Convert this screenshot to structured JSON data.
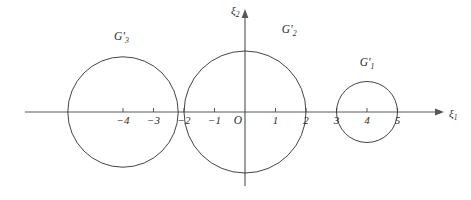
{
  "figure": {
    "background_color": "#ffffff",
    "axis_color": "#55585a",
    "curve_color": "#3a3a3a",
    "origin_label": "O"
  },
  "axes": {
    "x_axis": {
      "name": "xi-1",
      "label_base": "ξ",
      "label_sub": "1",
      "pixel_y": 112,
      "pixel_x_start": 25,
      "pixel_x_end": 437,
      "unit_px": 30.5,
      "origin_px": 245,
      "ticks": [
        {
          "value": -4,
          "label": "−4"
        },
        {
          "value": -3,
          "label": "−3"
        },
        {
          "value": -2,
          "label": "−2"
        },
        {
          "value": -1,
          "label": "−1"
        },
        {
          "value": 1,
          "label": "1"
        },
        {
          "value": 2,
          "label": "2"
        },
        {
          "value": 3,
          "label": "3"
        },
        {
          "value": 4,
          "label": "4"
        },
        {
          "value": 5,
          "label": "5"
        }
      ]
    },
    "y_axis": {
      "name": "xi-2",
      "label_base": "ξ",
      "label_sub": "2",
      "pixel_x": 245,
      "pixel_y_top": 16,
      "pixel_y_bottom": 186,
      "ticks": []
    }
  },
  "chart_data": {
    "type": "scatter",
    "title": "",
    "xlabel": "ξ1",
    "ylabel": "ξ2",
    "xlim": [
      -7.2,
      6.3
    ],
    "ylim": [
      -3.1,
      3.1
    ],
    "grid": false,
    "legend": "none",
    "shapes": [
      {
        "kind": "circle",
        "name": "G3-circle",
        "label_base": "G",
        "label_prime": "′",
        "label_sub": "3",
        "center_x": -4.0,
        "center_y": 0.0,
        "radius": 1.81,
        "label_pos_x": -4.05,
        "label_pos_y": 2.35
      },
      {
        "kind": "circle",
        "name": "G2-circle",
        "label_base": "G",
        "label_prime": "′",
        "label_sub": "2",
        "center_x": 0.0,
        "center_y": 0.0,
        "radius": 2.0,
        "label_pos_x": 1.45,
        "label_pos_y": 2.58
      },
      {
        "kind": "circle",
        "name": "G1-circle",
        "label_base": "G",
        "label_prime": "′",
        "label_sub": "1",
        "center_x": 4.0,
        "center_y": 0.0,
        "radius": 1.0,
        "label_pos_x": 4.0,
        "label_pos_y": 1.5
      }
    ],
    "annotations": [
      {
        "text": "O",
        "x": -0.23,
        "y": -0.38,
        "role": "origin"
      }
    ]
  }
}
